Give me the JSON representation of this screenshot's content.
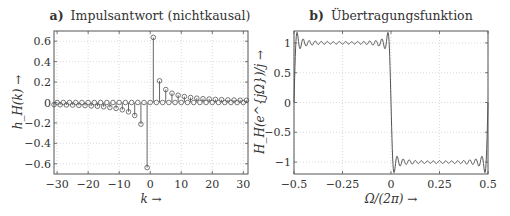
{
  "chart_data": [
    {
      "type": "stem",
      "title_prefix": "a)",
      "title": "Impulsantwort (nichtkausal)",
      "xlabel": "k →",
      "ylabel": "h_H(k) →",
      "xlim": [
        -31,
        31.5
      ],
      "ylim": [
        -0.7,
        0.7
      ],
      "xticks": [
        -30,
        -20,
        -10,
        0,
        10,
        20,
        30
      ],
      "xtick_labels": [
        "−30",
        "−20",
        "−10",
        "0",
        "10",
        "20",
        "30"
      ],
      "yticks": [
        0.6,
        0.4,
        0.2,
        0,
        -0.2,
        -0.4,
        -0.6
      ],
      "ytick_labels": [
        "0.6",
        "0.4",
        "0.2",
        "0",
        "−0.2",
        "−0.4",
        "−0.6"
      ],
      "grid": true,
      "k": [
        -31,
        -30,
        -29,
        -28,
        -27,
        -26,
        -25,
        -24,
        -23,
        -22,
        -21,
        -20,
        -19,
        -18,
        -17,
        -16,
        -15,
        -14,
        -13,
        -12,
        -11,
        -10,
        -9,
        -8,
        -7,
        -6,
        -5,
        -4,
        -3,
        -2,
        -1,
        0,
        1,
        2,
        3,
        4,
        5,
        6,
        7,
        8,
        9,
        10,
        11,
        12,
        13,
        14,
        15,
        16,
        17,
        18,
        19,
        20,
        21,
        22,
        23,
        24,
        25,
        26,
        27,
        28,
        29,
        30,
        31
      ],
      "values": [
        -0.021,
        0,
        -0.022,
        0,
        -0.024,
        0,
        -0.025,
        0,
        -0.028,
        0,
        -0.03,
        0,
        -0.034,
        0,
        -0.037,
        0,
        -0.042,
        0,
        -0.049,
        0,
        -0.058,
        0,
        -0.071,
        0,
        -0.091,
        0,
        -0.127,
        0,
        -0.212,
        0,
        -0.637,
        0,
        0.637,
        0,
        0.212,
        0,
        0.127,
        0,
        0.091,
        0,
        0.071,
        0,
        0.058,
        0,
        0.049,
        0,
        0.042,
        0,
        0.037,
        0,
        0.034,
        0,
        0.03,
        0,
        0.028,
        0,
        0.025,
        0,
        0.024,
        0,
        0.022,
        0,
        0.021
      ]
    },
    {
      "type": "line",
      "title_prefix": "b)",
      "title": "Übertragungsfunktion",
      "xlabel": "Ω/(2π) →",
      "ylabel": "H_H(e^{jΩ})/j →",
      "xlim": [
        -0.5,
        0.5
      ],
      "ylim": [
        -1.2,
        1.2
      ],
      "xticks": [
        -0.5,
        -0.25,
        0,
        0.25,
        0.5
      ],
      "xtick_labels": [
        "−0.5",
        "−0.25",
        "0",
        "0.25",
        "0.5"
      ],
      "yticks": [
        1,
        0.5,
        0,
        -0.5,
        -1
      ],
      "ytick_labels": [
        "1",
        "0.5",
        "0",
        "−0.5",
        "−1"
      ],
      "grid": true,
      "description": "Approx. +1 for Ω/(2π) in (−0.5, 0) and −1 in (0, 0.5) with Gibbs ripple (~16 ripples per half, amplitude ≈ ±0.07); crosses 0 at −0.5, 0 and 0.5",
      "x": [
        -0.5,
        -0.49,
        -0.25,
        -0.01,
        0,
        0.01,
        0.25,
        0.49,
        0.5
      ],
      "values": [
        0,
        1.0,
        1.0,
        1.0,
        0,
        -1.0,
        -1.0,
        -1.0,
        0
      ]
    }
  ]
}
